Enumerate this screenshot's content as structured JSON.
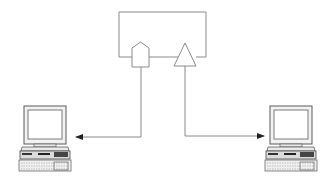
{
  "diagram": {
    "colors": {
      "line": "#8a8a8a",
      "background": "#ffffff",
      "computer_outline": "#6a6a6a",
      "computer_dark": "#2a2a2a"
    },
    "nodes": [
      {
        "id": "central-box",
        "type": "rectangle",
        "label": ""
      },
      {
        "id": "port-pentagon",
        "type": "pentagon",
        "label": ""
      },
      {
        "id": "port-triangle",
        "type": "triangle",
        "label": ""
      },
      {
        "id": "computer-left",
        "type": "desktop-computer",
        "label": ""
      },
      {
        "id": "computer-right",
        "type": "desktop-computer",
        "label": ""
      }
    ],
    "edges": [
      {
        "from": "port-pentagon",
        "to": "computer-left",
        "arrow": "end"
      },
      {
        "from": "port-triangle",
        "to": "computer-right",
        "arrow": "end"
      }
    ]
  }
}
